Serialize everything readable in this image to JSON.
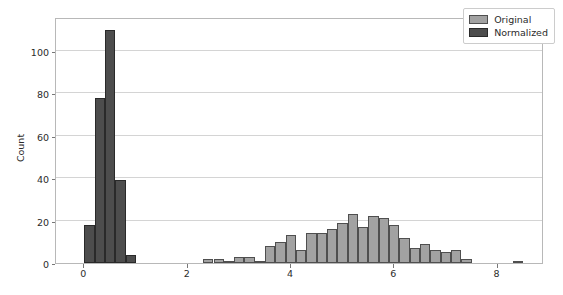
{
  "chart_data": {
    "type": "bar",
    "title": "",
    "xlabel": "",
    "ylabel": "Count",
    "xlim": [
      -0.55,
      8.9
    ],
    "ylim": [
      0,
      116
    ],
    "grid": true,
    "legend_position": "upper right",
    "xticks": [
      "0",
      "2",
      "4",
      "6",
      "8"
    ],
    "xtick_values": [
      0,
      2,
      4,
      6,
      8
    ],
    "yticks": [
      "0",
      "20",
      "40",
      "60",
      "80",
      "100"
    ],
    "ytick_values": [
      0,
      20,
      40,
      60,
      80,
      100
    ],
    "bin_width": 0.2,
    "series": [
      {
        "name": "Normalized",
        "color": "#4d4d4d",
        "edge_color": "#2a2a2a",
        "bins": [
          0.0,
          0.2,
          0.4,
          0.6,
          0.8
        ],
        "values": [
          18,
          78,
          110,
          39,
          4
        ]
      },
      {
        "name": "Original",
        "color": "#a2a2a2",
        "edge_color": "#4f4f4f",
        "bins": [
          2.3,
          2.5,
          2.7,
          2.9,
          3.1,
          3.3,
          3.5,
          3.7,
          3.9,
          4.1,
          4.3,
          4.5,
          4.7,
          4.9,
          5.1,
          5.3,
          5.5,
          5.7,
          5.9,
          6.1,
          6.3,
          6.5,
          6.7,
          6.9,
          7.1,
          7.3,
          8.3
        ],
        "values": [
          2,
          2,
          1,
          3,
          3,
          1,
          8,
          10,
          13,
          6,
          14,
          14,
          16,
          19,
          23,
          17,
          22,
          21,
          18,
          12,
          7,
          9,
          6,
          5,
          6,
          2,
          1
        ]
      }
    ]
  },
  "legend": {
    "items": [
      {
        "label": "Original",
        "swatch": "original"
      },
      {
        "label": "Normalized",
        "swatch": "normalized"
      }
    ]
  },
  "axes": {
    "y_axis_label": "Count"
  },
  "colors": {
    "original": "#a2a2a2",
    "normalized": "#4d4d4d",
    "grid": "#d4d4d4",
    "frame": "#b8b8b8",
    "text": "#2b2b2b"
  }
}
